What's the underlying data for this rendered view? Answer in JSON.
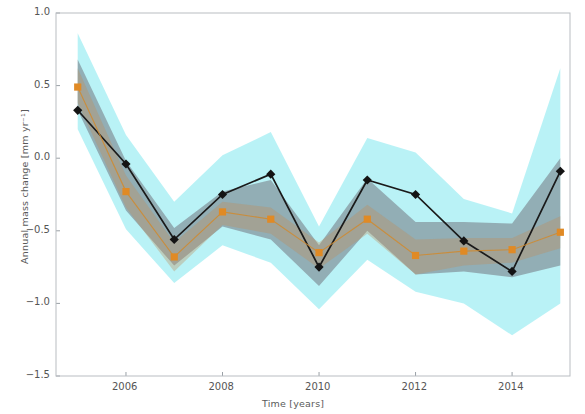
{
  "chart_data": {
    "type": "line",
    "title": "",
    "subtitle": "",
    "xlabel": "Time [years]",
    "ylabel": "Annual mass change [mm yr⁻¹]",
    "x": [
      2005,
      2006,
      2007,
      2008,
      2009,
      2010,
      2011,
      2012,
      2013,
      2014,
      2015
    ],
    "xlim": [
      2004.55,
      2015.2
    ],
    "ylim": [
      -1.5,
      1.0
    ],
    "xticks": [
      2006,
      2008,
      2010,
      2012,
      2014
    ],
    "xticklabels": [
      "2006",
      "2008",
      "2010",
      "2012",
      "2014"
    ],
    "yticks": [
      -1.5,
      -1.0,
      -0.5,
      0.0,
      0.5,
      1.0
    ],
    "yticklabels": [
      "−1.5",
      "−1.0",
      "−0.5",
      "0.0",
      "0.5",
      "1.0"
    ],
    "grid": false,
    "legend": "none",
    "series": [
      {
        "name": "black-series",
        "marker": "diamond",
        "color": "#141414",
        "values": [
          0.33,
          -0.04,
          -0.56,
          -0.25,
          -0.11,
          -0.75,
          -0.15,
          -0.25,
          -0.57,
          -0.78,
          -0.09
        ]
      },
      {
        "name": "orange-series",
        "marker": "square",
        "color": "#e08a25",
        "values": [
          0.49,
          -0.23,
          -0.68,
          -0.37,
          -0.42,
          -0.65,
          -0.42,
          -0.67,
          -0.64,
          -0.63,
          -0.51
        ]
      }
    ],
    "bands": [
      {
        "name": "cyan-uncertainty-band",
        "color": "#7fe8ef",
        "upper": [
          0.86,
          0.16,
          -0.3,
          0.02,
          0.18,
          -0.47,
          0.14,
          0.04,
          -0.28,
          -0.38,
          0.62
        ],
        "lower": [
          0.2,
          -0.49,
          -0.86,
          -0.6,
          -0.72,
          -1.04,
          -0.7,
          -0.92,
          -1.0,
          -1.22,
          -1.0
        ]
      },
      {
        "name": "gray-uncertainty-band",
        "color": "#6f6f78",
        "upper": [
          0.68,
          -0.02,
          -0.48,
          -0.23,
          -0.15,
          -0.6,
          -0.14,
          -0.44,
          -0.44,
          -0.45,
          0.0
        ],
        "lower": [
          0.33,
          -0.36,
          -0.74,
          -0.47,
          -0.56,
          -0.88,
          -0.5,
          -0.8,
          -0.78,
          -0.82,
          -0.74
        ]
      },
      {
        "name": "tan-uncertainty-band",
        "color": "#c08b5a",
        "upper": [
          0.62,
          -0.12,
          -0.58,
          -0.3,
          -0.34,
          -0.58,
          -0.32,
          -0.56,
          -0.55,
          -0.55,
          -0.4
        ],
        "lower": [
          0.38,
          -0.34,
          -0.78,
          -0.46,
          -0.52,
          -0.76,
          -0.52,
          -0.8,
          -0.74,
          -0.72,
          -0.62
        ]
      }
    ]
  },
  "axes": {
    "x_axis_label": "Time [years]",
    "y_axis_label": "Annual mass change [mm yr⁻¹]"
  }
}
